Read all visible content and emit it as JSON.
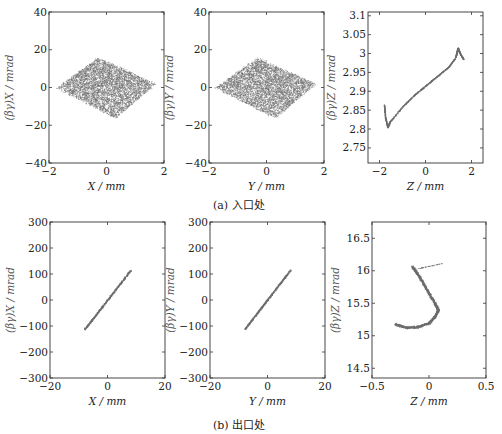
{
  "figure": {
    "row_a_caption": "(a) 入口处",
    "row_b_caption": "(b) 出口处"
  },
  "colors": {
    "frame": "#333333",
    "scatter": "#6e6e6e",
    "text": "#222222",
    "ylabel": "#555555"
  },
  "chart_data": [
    {
      "id": "a1",
      "type": "scatter",
      "row": "a",
      "title": "",
      "xlabel": "X / mm",
      "ylabel": "(βγ)X / mrad",
      "xlim": [
        -2,
        2
      ],
      "ylim": [
        -40,
        40
      ],
      "xticks": [
        -2,
        0,
        2
      ],
      "xtick_labels": [
        "−2",
        "0",
        "2"
      ],
      "yticks": [
        -40,
        -20,
        0,
        20,
        40
      ],
      "ytick_labels": [
        "−40",
        "−20",
        "0",
        "20",
        "40"
      ],
      "grid": false,
      "legend": null,
      "shape": "diamond-cloud",
      "vertices": [
        [
          -1.75,
          0
        ],
        [
          -0.3,
          16
        ],
        [
          1.7,
          2
        ],
        [
          0.3,
          -16
        ]
      ],
      "description": "dense tilted rhombus-shaped particle cloud, X ≈ −1.8..1.8 mm, (βγ)X ≈ −17..17 mrad"
    },
    {
      "id": "a2",
      "type": "scatter",
      "row": "a",
      "title": "",
      "xlabel": "Y / mm",
      "ylabel": "(βγ)Y / mrad",
      "xlim": [
        -2,
        2
      ],
      "ylim": [
        -40,
        40
      ],
      "xticks": [
        -2,
        0,
        2
      ],
      "xtick_labels": [
        "−2",
        "0",
        "2"
      ],
      "yticks": [
        -40,
        -20,
        0,
        20,
        40
      ],
      "ytick_labels": [
        "−40",
        "−20",
        "0",
        "20",
        "40"
      ],
      "grid": false,
      "legend": null,
      "shape": "diamond-cloud",
      "vertices": [
        [
          -1.8,
          0
        ],
        [
          -0.3,
          16
        ],
        [
          1.7,
          2
        ],
        [
          0.3,
          -16
        ]
      ],
      "description": "dense tilted rhombus-shaped particle cloud, Y ≈ −1.8..1.8 mm, (βγ)Y ≈ −17..17 mrad"
    },
    {
      "id": "a3",
      "type": "scatter",
      "row": "a",
      "title": "",
      "xlabel": "Z / mm",
      "ylabel": "(βγ)Z / mrad",
      "xlim": [
        -2.5,
        2.5
      ],
      "ylim": [
        2.71,
        3.11
      ],
      "xticks": [
        -2,
        0,
        2
      ],
      "xtick_labels": [
        "−2",
        "0",
        "2"
      ],
      "yticks": [
        2.75,
        2.8,
        2.85,
        2.9,
        2.95,
        3.0,
        3.05,
        3.1
      ],
      "ytick_labels": [
        "2.75",
        "2.8",
        "2.85",
        "2.9",
        "2.95",
        "3",
        "3.05",
        "3.1"
      ],
      "grid": false,
      "legend": null,
      "shape": "curve",
      "points": [
        [
          -1.8,
          2.865
        ],
        [
          -1.75,
          2.83
        ],
        [
          -1.65,
          2.805
        ],
        [
          -1.55,
          2.82
        ],
        [
          -1.0,
          2.86
        ],
        [
          -0.5,
          2.89
        ],
        [
          0.0,
          2.915
        ],
        [
          0.5,
          2.94
        ],
        [
          1.0,
          2.965
        ],
        [
          1.3,
          2.99
        ],
        [
          1.4,
          3.015
        ],
        [
          1.5,
          3.0
        ],
        [
          1.65,
          2.985
        ]
      ],
      "description": "thin S-shaped longitudinal phase space line from (−1.8, 2.86) to (1.4, 3.015)"
    },
    {
      "id": "b1",
      "type": "scatter",
      "row": "b",
      "title": "",
      "xlabel": "X / mm",
      "ylabel": "(βγ)X / mrad",
      "xlim": [
        -20,
        20
      ],
      "ylim": [
        -300,
        300
      ],
      "xticks": [
        -20,
        0,
        20
      ],
      "xtick_labels": [
        "−20",
        "0",
        "20"
      ],
      "yticks": [
        -300,
        -200,
        -100,
        0,
        100,
        200,
        300
      ],
      "ytick_labels": [
        "−300",
        "−200",
        "−100",
        "0",
        "100",
        "200",
        "300"
      ],
      "grid": false,
      "legend": null,
      "shape": "line",
      "points": [
        [
          -8,
          -112
        ],
        [
          8,
          115
        ]
      ],
      "description": "narrow diagonal band, slope ≈ 14 mrad/mm"
    },
    {
      "id": "b2",
      "type": "scatter",
      "row": "b",
      "title": "",
      "xlabel": "Y / mm",
      "ylabel": "(βγ)Y / mrad",
      "xlim": [
        -20,
        20
      ],
      "ylim": [
        -300,
        300
      ],
      "xticks": [
        -20,
        0,
        20
      ],
      "xtick_labels": [
        "−20",
        "0",
        "20"
      ],
      "yticks": [
        -300,
        -200,
        -100,
        0,
        100,
        200,
        300
      ],
      "ytick_labels": [
        "−300",
        "−200",
        "−100",
        "0",
        "100",
        "200",
        "300"
      ],
      "grid": false,
      "legend": null,
      "shape": "line",
      "points": [
        [
          -8,
          -112
        ],
        [
          8,
          117
        ]
      ],
      "description": "narrow diagonal band, slope ≈ 14 mrad/mm"
    },
    {
      "id": "b3",
      "type": "scatter",
      "row": "b",
      "title": "",
      "xlabel": "Z / mm",
      "ylabel": "(βγ)Z / mrad",
      "xlim": [
        -0.5,
        0.5
      ],
      "ylim": [
        14.35,
        16.75
      ],
      "xticks": [
        -0.5,
        0,
        0.5
      ],
      "xtick_labels": [
        "−0.5",
        "0",
        "0.5"
      ],
      "yticks": [
        14.5,
        15,
        15.5,
        16,
        16.5
      ],
      "ytick_labels": [
        "14.5",
        "15",
        "15.5",
        "16",
        "16.5"
      ],
      "grid": false,
      "legend": null,
      "shape": "hook",
      "points": [
        [
          -0.3,
          15.18
        ],
        [
          -0.2,
          15.13
        ],
        [
          -0.1,
          15.14
        ],
        [
          0.0,
          15.2
        ],
        [
          0.05,
          15.3
        ],
        [
          0.08,
          15.4
        ],
        [
          0.05,
          15.5
        ],
        [
          0.0,
          15.65
        ],
        [
          -0.05,
          15.8
        ],
        [
          -0.1,
          15.95
        ],
        [
          -0.15,
          16.07
        ]
      ],
      "branch": [
        [
          -0.12,
          16.03
        ],
        [
          0.12,
          16.12
        ]
      ],
      "description": "J-shaped hook: lower arc from Z≈−0.3 to 0.08 near 15.15–15.3, vertical arm rising to 16.07 at Z≈−0.15, thin branch to (0.12, 16.12)"
    }
  ]
}
